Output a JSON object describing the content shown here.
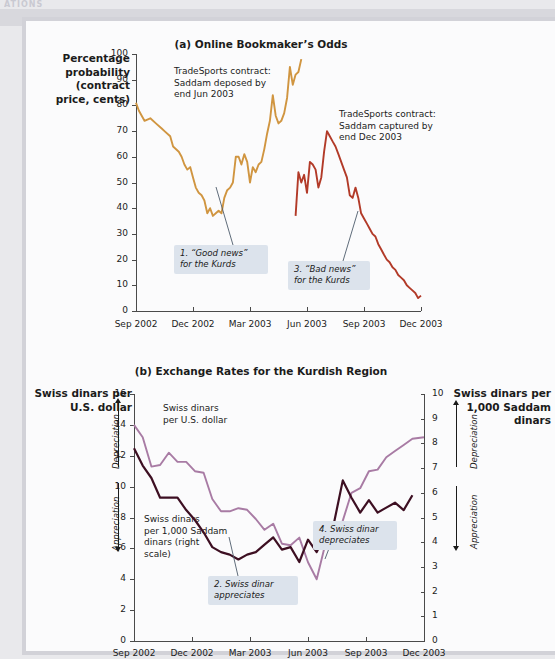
{
  "runhead": "ATIONS",
  "figure": {
    "panel_a": {
      "title": "(a) Online Bookmaker’s Odds",
      "ylabel": "Percentage\nprobability\n(contract\nprice, cents)",
      "yticks": [
        "0",
        "10",
        "20",
        "30",
        "40",
        "50",
        "60",
        "70",
        "80",
        "90",
        "100"
      ],
      "xticks": [
        "Sep 2002",
        "Dec 2002",
        "Mar 2003",
        "Jun 2003",
        "Sep 2003",
        "Dec 2003"
      ],
      "series_notes": [
        "TradeSports contract:\nSaddam deposed by\nend Jun 2003",
        "TradeSports contract:\nSaddam captured by\nend Dec 2003"
      ],
      "callouts": [
        "1. “Good news”\nfor the Kurds",
        "3. “Bad news”\nfor the Kurds"
      ]
    },
    "panel_b": {
      "title": "(b) Exchange Rates for the Kurdish Region",
      "ylabel_left": "Swiss dinars per\nU.S. dollar",
      "ylabel_right": "Swiss dinars per\n1,000 Saddam\ndinars",
      "yticks_left": [
        "0",
        "2",
        "4",
        "6",
        "8",
        "10",
        "12",
        "14",
        "16"
      ],
      "yticks_right": [
        "0",
        "1",
        "2",
        "3",
        "4",
        "5",
        "6",
        "7",
        "8",
        "9",
        "10"
      ],
      "xticks": [
        "Sep 2002",
        "Dec 2002",
        "Mar 2003",
        "Jun 2003",
        "Sep 2003",
        "Dec 2003"
      ],
      "arrow_labels": {
        "up": "Depreciation",
        "down": "Appreciation"
      },
      "series_notes": [
        "Swiss dinars\nper U.S. dollar",
        "Swiss dinars\nper 1,000 Saddam\ndinars (right\nscale)"
      ],
      "callouts": [
        "2. Swiss dinar\nappreciates",
        "4. Swiss dinar\ndepreciates"
      ]
    }
  },
  "colors": {
    "deposed_line": "#d09540",
    "captured_line": "#b23a28",
    "usd_line": "#a87ba4",
    "saddam_line": "#3d0f22",
    "callout_bg": "#dce3ec",
    "axis": "#4a4a4a",
    "panel_bg": "#fbfbfc",
    "page_bg": "#e9e9ec"
  },
  "chart_data": [
    {
      "type": "line",
      "title": "(a) Online Bookmaker’s Odds",
      "xlabel": "",
      "ylabel": "Percentage probability (contract price, cents)",
      "ylim": [
        0,
        100
      ],
      "ytick_values": [
        0,
        10,
        20,
        30,
        40,
        50,
        60,
        70,
        80,
        90,
        100
      ],
      "xtick_labels": [
        "Sep 2002",
        "Dec 2002",
        "Mar 2003",
        "Jun 2003",
        "Sep 2003",
        "Dec 2003"
      ],
      "grid": false,
      "legend_position": "inline annotations",
      "series": [
        {
          "name": "TradeSports contract: Saddam deposed by end Jun 2003",
          "color": "#d09540",
          "x": [
            0.0,
            0.01,
            0.02,
            0.03,
            0.05,
            0.07,
            0.09,
            0.1,
            0.12,
            0.13,
            0.15,
            0.16,
            0.17,
            0.18,
            0.19,
            0.2,
            0.21,
            0.22,
            0.23,
            0.24,
            0.25,
            0.26,
            0.27,
            0.28,
            0.29,
            0.3,
            0.31,
            0.32,
            0.33,
            0.34,
            0.35,
            0.36,
            0.37,
            0.38,
            0.39,
            0.4,
            0.41,
            0.42,
            0.43,
            0.44,
            0.45,
            0.46,
            0.47,
            0.48,
            0.49,
            0.5,
            0.51,
            0.52,
            0.53,
            0.54,
            0.55,
            0.56,
            0.57,
            0.58
          ],
          "y": [
            81,
            78,
            76,
            74,
            75,
            73,
            71,
            70,
            68,
            64,
            62,
            60,
            57,
            55,
            56,
            52,
            48,
            46,
            45,
            43,
            38,
            40,
            37,
            38,
            39,
            38,
            44,
            47,
            48,
            50,
            60,
            60,
            57,
            61,
            58,
            50,
            56,
            54,
            57,
            58,
            63,
            69,
            74,
            84,
            76,
            73,
            74,
            77,
            83,
            95,
            88,
            92,
            93,
            98
          ],
          "x_description": "Sep 2002 through late Apr 2003 (contract expired/resolved)"
        },
        {
          "name": "TradeSports contract: Saddam captured by end Dec 2003",
          "color": "#b23a28",
          "x": [
            0.56,
            0.57,
            0.58,
            0.59,
            0.6,
            0.61,
            0.62,
            0.63,
            0.64,
            0.65,
            0.66,
            0.67,
            0.68,
            0.69,
            0.7,
            0.71,
            0.72,
            0.73,
            0.74,
            0.75,
            0.76,
            0.77,
            0.78,
            0.79,
            0.8,
            0.81,
            0.82,
            0.83,
            0.84,
            0.85,
            0.86,
            0.87,
            0.88,
            0.89,
            0.9,
            0.91,
            0.92,
            0.93,
            0.94,
            0.95,
            0.96,
            0.97,
            0.98,
            0.99,
            1.0
          ],
          "y": [
            37,
            54,
            50,
            53,
            46,
            58,
            57,
            55,
            48,
            52,
            62,
            70,
            68,
            66,
            64,
            61,
            58,
            55,
            52,
            45,
            44,
            48,
            44,
            38,
            36,
            34,
            32,
            30,
            29,
            26,
            24,
            22,
            20,
            19,
            17,
            16,
            14,
            13,
            12,
            10,
            9,
            8,
            7,
            5,
            6
          ],
          "x_description": "Jun 2003 through Dec 2003"
        }
      ],
      "annotations": [
        {
          "text": "1. “Good news” for the Kurds",
          "points_to": "orange line jump in late Mar 2003 from ~50 to ~60"
        },
        {
          "text": "3. “Bad news” for the Kurds",
          "points_to": "red line peak ~70 in Aug 2003 then decline"
        }
      ]
    },
    {
      "type": "line",
      "title": "(b) Exchange Rates for the Kurdish Region",
      "xlabel": "",
      "ylabel": "Swiss dinars per U.S. dollar",
      "ylabel_secondary": "Swiss dinars per 1,000 Saddam dinars",
      "ylim": [
        0,
        16
      ],
      "ylim_secondary": [
        0,
        10
      ],
      "ytick_values": [
        0,
        2,
        4,
        6,
        8,
        10,
        12,
        14,
        16
      ],
      "ytick_values_secondary": [
        0,
        1,
        2,
        3,
        4,
        5,
        6,
        7,
        8,
        9,
        10
      ],
      "xtick_labels": [
        "Sep 2002",
        "Dec 2002",
        "Mar 2003",
        "Jun 2003",
        "Sep 2003",
        "Dec 2003"
      ],
      "grid": false,
      "legend_position": "inline annotations",
      "series": [
        {
          "name": "Swiss dinars per U.S. dollar",
          "axis": "left",
          "color": "#a87ba4",
          "x": [
            0.0,
            0.03,
            0.06,
            0.09,
            0.12,
            0.15,
            0.18,
            0.21,
            0.24,
            0.27,
            0.3,
            0.33,
            0.36,
            0.39,
            0.42,
            0.45,
            0.48,
            0.51,
            0.54,
            0.57,
            0.6,
            0.63,
            0.66,
            0.69,
            0.72,
            0.75,
            0.78,
            0.81,
            0.84,
            0.87,
            0.9,
            0.93,
            0.96,
            1.0
          ],
          "y": [
            14.0,
            13.2,
            11.3,
            11.4,
            12.2,
            11.6,
            11.6,
            11.0,
            10.9,
            9.2,
            8.4,
            8.4,
            8.6,
            8.5,
            7.9,
            7.2,
            7.6,
            6.3,
            6.2,
            6.7,
            5.1,
            4.0,
            6.3,
            6.4,
            7.8,
            9.6,
            9.9,
            11.0,
            11.1,
            11.9,
            12.3,
            12.7,
            13.1,
            13.2
          ]
        },
        {
          "name": "Swiss dinars per 1,000 Saddam dinars (right scale)",
          "axis": "right",
          "color": "#3d0f22",
          "x": [
            0.0,
            0.03,
            0.06,
            0.09,
            0.12,
            0.15,
            0.18,
            0.21,
            0.24,
            0.27,
            0.3,
            0.33,
            0.36,
            0.39,
            0.42,
            0.45,
            0.48,
            0.51,
            0.54,
            0.57,
            0.6,
            0.63,
            0.66,
            0.69,
            0.72,
            0.75,
            0.78,
            0.81,
            0.84,
            0.87,
            0.9,
            0.93,
            0.96
          ],
          "y": [
            7.8,
            7.1,
            6.6,
            5.8,
            5.8,
            5.8,
            5.3,
            4.9,
            4.4,
            3.8,
            3.6,
            3.5,
            3.3,
            3.5,
            3.6,
            3.9,
            4.2,
            3.7,
            3.8,
            3.2,
            4.1,
            3.6,
            4.3,
            4.8,
            6.5,
            5.8,
            5.2,
            5.7,
            5.2,
            5.4,
            5.6,
            5.3,
            5.9
          ]
        }
      ],
      "annotations": [
        {
          "text": "2. Swiss dinar appreciates",
          "points_to": "dark line declining through Mar 2003"
        },
        {
          "text": "4. Swiss dinar depreciates",
          "points_to": "dark line rising sharply into Sep 2003"
        }
      ]
    }
  ]
}
